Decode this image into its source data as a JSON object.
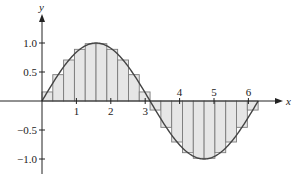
{
  "chart_data": {
    "type": "area",
    "title": "",
    "xlabel": "x",
    "ylabel": "y",
    "function": "sin(x)",
    "approximation": "midpoint Riemann sum",
    "interval": [
      0,
      6.2832
    ],
    "n_rectangles": 20,
    "rect_width": 0.31416,
    "xlim": [
      -0.95,
      7.0
    ],
    "ylim": [
      -1.25,
      1.45
    ],
    "x_ticks": [
      1,
      2,
      3,
      4,
      5,
      6
    ],
    "x_tick_labels": [
      "1",
      "2",
      "3",
      "4",
      "5",
      "6"
    ],
    "y_ticks": [
      1.0,
      0.5,
      -0.5,
      -1.0
    ],
    "y_tick_labels": [
      "1.0",
      "0.5",
      "−0.5",
      "−1.0"
    ],
    "rectangles": [
      {
        "x0": 0.0,
        "x1": 0.3142,
        "height": 0.156
      },
      {
        "x0": 0.3142,
        "x1": 0.6283,
        "height": 0.454
      },
      {
        "x0": 0.6283,
        "x1": 0.9425,
        "height": 0.707
      },
      {
        "x0": 0.9425,
        "x1": 1.2566,
        "height": 0.891
      },
      {
        "x0": 1.2566,
        "x1": 1.5708,
        "height": 0.988
      },
      {
        "x0": 1.5708,
        "x1": 1.885,
        "height": 0.988
      },
      {
        "x0": 1.885,
        "x1": 2.1991,
        "height": 0.891
      },
      {
        "x0": 2.1991,
        "x1": 2.5133,
        "height": 0.707
      },
      {
        "x0": 2.5133,
        "x1": 2.8274,
        "height": 0.454
      },
      {
        "x0": 2.8274,
        "x1": 3.1416,
        "height": 0.156
      },
      {
        "x0": 3.1416,
        "x1": 3.4558,
        "height": -0.156
      },
      {
        "x0": 3.4558,
        "x1": 3.7699,
        "height": -0.454
      },
      {
        "x0": 3.7699,
        "x1": 4.0841,
        "height": -0.707
      },
      {
        "x0": 4.0841,
        "x1": 4.3982,
        "height": -0.891
      },
      {
        "x0": 4.3982,
        "x1": 4.7124,
        "height": -0.988
      },
      {
        "x0": 4.7124,
        "x1": 5.0265,
        "height": -0.988
      },
      {
        "x0": 5.0265,
        "x1": 5.3407,
        "height": -0.891
      },
      {
        "x0": 5.3407,
        "x1": 5.6549,
        "height": -0.707
      },
      {
        "x0": 5.6549,
        "x1": 5.969,
        "height": -0.454
      },
      {
        "x0": 5.969,
        "x1": 6.2832,
        "height": -0.156
      }
    ],
    "grid": false,
    "legend": null,
    "colors": {
      "rect_fill": "#e6e6e6",
      "rect_stroke": "#7a7a7a",
      "curve": "#444444",
      "axis": "#222222"
    }
  },
  "layout": {
    "origin_px": [
      42,
      101
    ],
    "px_per_x_unit": 34.4,
    "px_per_y_unit": 58,
    "x_axis_px": [
      0,
      283
    ],
    "y_axis_px": [
      14,
      174
    ]
  }
}
